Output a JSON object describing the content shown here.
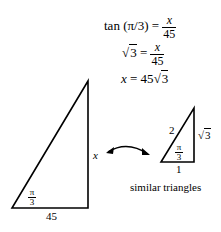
{
  "equations": {
    "line1": {
      "lhs": "tan (π/3) =",
      "num": "x",
      "den": "45"
    },
    "line2": {
      "lhs_sqrt": "3",
      "eq": "=",
      "num": "x",
      "den": "45"
    },
    "line3": {
      "lhs": "x",
      "eq": "= 45",
      "sqrt": "3"
    }
  },
  "large_triangle": {
    "base_label": "45",
    "height_label": "x",
    "angle_num": "π",
    "angle_den": "3"
  },
  "small_triangle": {
    "hyp_label": "2",
    "height_sqrt": "3",
    "base_label": "1",
    "angle_num": "π",
    "angle_den": "3"
  },
  "caption": "similar triangles"
}
